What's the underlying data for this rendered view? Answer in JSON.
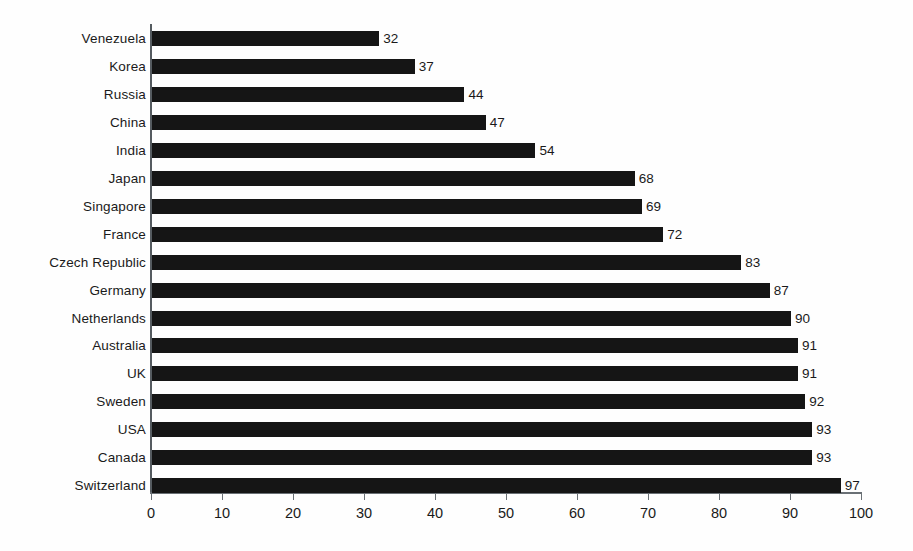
{
  "chart_data": {
    "type": "bar",
    "orientation": "horizontal",
    "title": "",
    "subtitle": "",
    "xlabel": "",
    "ylabel": "",
    "xlim": [
      0,
      100
    ],
    "xticks": [
      0,
      10,
      20,
      30,
      40,
      50,
      60,
      70,
      80,
      90,
      100
    ],
    "xtick_labels": [
      "0",
      "10",
      "20",
      "30",
      "40",
      "50",
      "60",
      "70",
      "80",
      "90",
      "100"
    ],
    "grid": false,
    "legend": null,
    "bar_color": "#151515",
    "axis_color": "#6a7075",
    "background_color": "#fefefe",
    "show_value_labels": true,
    "categories": [
      "Venezuela",
      "Korea",
      "Russia",
      "China",
      "India",
      "Japan",
      "Singapore",
      "France",
      "Czech Republic",
      "Germany",
      "Netherlands",
      "Australia",
      "UK",
      "Sweden",
      "USA",
      "Canada",
      "Switzerland"
    ],
    "values": [
      32,
      37,
      44,
      47,
      54,
      68,
      69,
      72,
      83,
      87,
      90,
      91,
      91,
      92,
      93,
      93,
      97
    ],
    "value_labels": [
      "32",
      "37",
      "44",
      "47",
      "54",
      "68",
      "69",
      "72",
      "83",
      "87",
      "90",
      "91",
      "91",
      "92",
      "93",
      "93",
      "97"
    ],
    "rows": [
      {
        "label": "Venezuela",
        "value": 32,
        "value_label": "32"
      },
      {
        "label": "Korea",
        "value": 37,
        "value_label": "37"
      },
      {
        "label": "Russia",
        "value": 44,
        "value_label": "44"
      },
      {
        "label": "China",
        "value": 47,
        "value_label": "47"
      },
      {
        "label": "India",
        "value": 54,
        "value_label": "54"
      },
      {
        "label": "Japan",
        "value": 68,
        "value_label": "68"
      },
      {
        "label": "Singapore",
        "value": 69,
        "value_label": "69"
      },
      {
        "label": "France",
        "value": 72,
        "value_label": "72"
      },
      {
        "label": "Czech Republic",
        "value": 83,
        "value_label": "83"
      },
      {
        "label": "Germany",
        "value": 87,
        "value_label": "87"
      },
      {
        "label": "Netherlands",
        "value": 90,
        "value_label": "90"
      },
      {
        "label": "Australia",
        "value": 91,
        "value_label": "91"
      },
      {
        "label": "UK",
        "value": 91,
        "value_label": "91"
      },
      {
        "label": "Sweden",
        "value": 92,
        "value_label": "92"
      },
      {
        "label": "USA",
        "value": 93,
        "value_label": "93"
      },
      {
        "label": "Canada",
        "value": 93,
        "value_label": "93"
      },
      {
        "label": "Switzerland",
        "value": 97,
        "value_label": "97"
      }
    ]
  }
}
